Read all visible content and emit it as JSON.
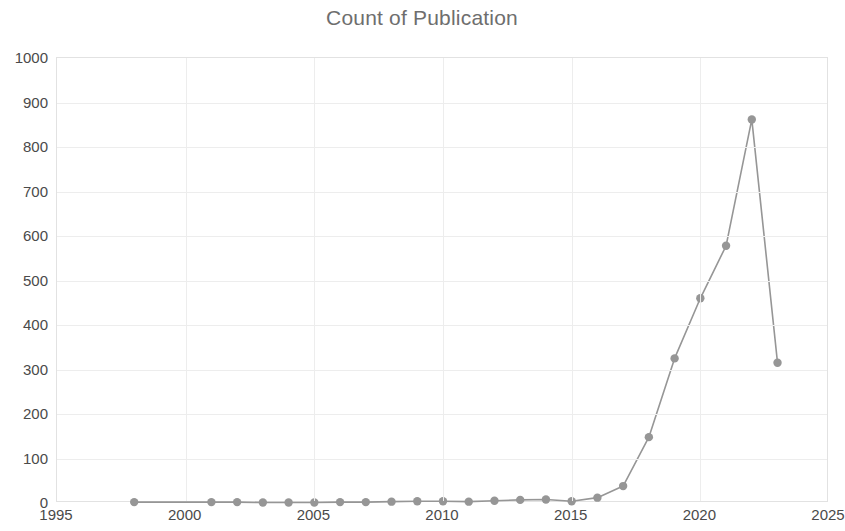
{
  "chart": {
    "title": "Count of Publication"
  },
  "chart_data": {
    "type": "line",
    "title": "Count of Publication",
    "subtitle": "",
    "xlabel": "",
    "ylabel": "",
    "xlim": [
      1995,
      2025
    ],
    "ylim": [
      0,
      1000
    ],
    "grid": true,
    "legend": false,
    "legend_position": "none",
    "series_color": "#969696",
    "marker": "circle",
    "x_ticks": [
      "1995",
      "2000",
      "2005",
      "2010",
      "2015",
      "2020",
      "2025"
    ],
    "y_ticks": [
      "0",
      "100",
      "200",
      "300",
      "400",
      "500",
      "600",
      "700",
      "800",
      "900",
      "1000"
    ],
    "x": [
      1998,
      2001,
      2002,
      2003,
      2004,
      2005,
      2006,
      2007,
      2008,
      2009,
      2010,
      2011,
      2012,
      2013,
      2014,
      2015,
      2016,
      2017,
      2018,
      2019,
      2020,
      2021,
      2022,
      2023
    ],
    "series": [
      {
        "name": "Count of Publication",
        "values": [
          2,
          2,
          2,
          1,
          1,
          1,
          2,
          2,
          3,
          4,
          4,
          3,
          5,
          7,
          8,
          4,
          12,
          38,
          148,
          325,
          460,
          578,
          862,
          315
        ]
      }
    ]
  }
}
